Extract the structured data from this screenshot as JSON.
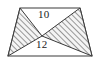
{
  "figure": {
    "background_color": "#ffffff",
    "stroke_color": "#3a3a3a",
    "hatch_color": "#555555",
    "hatch_fill": "#f2f2f2",
    "labels": {
      "top_edge": "10",
      "bottom_edge": "12"
    },
    "shapes": {
      "trapezoid": {
        "name": "trapezoid-outline",
        "points": "20,8 80,8 92,56 8,56"
      },
      "left_triangle": {
        "name": "left-shaded-triangle",
        "points": "20,8 8,56 42,36",
        "hatched": true
      },
      "right_triangle": {
        "name": "right-shaded-triangle",
        "points": "80,8 92,56 42,36",
        "hatched": true
      }
    },
    "vertices": {
      "top_left": "20,8",
      "top_right": "80,8",
      "bottom_right": "92,56",
      "bottom_left": "8,56",
      "center_apex": "42,36"
    }
  }
}
